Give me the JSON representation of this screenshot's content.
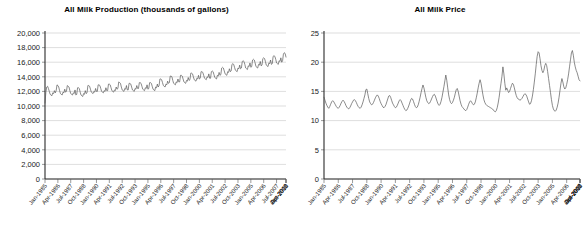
{
  "chart_data": [
    {
      "type": "line",
      "name": "all-milk-production",
      "title": "All Milk Production (thousands of gallons)",
      "xlabel": "",
      "ylabel": "",
      "ylim": [
        0,
        20000
      ],
      "ytick_labels": [
        "20,000",
        "18,000",
        "16,000",
        "14,000",
        "12,000",
        "10,000",
        "8,000",
        "6,000",
        "4,000",
        "2,000",
        "0"
      ],
      "ytick_values": [
        20000,
        18000,
        16000,
        14000,
        12000,
        10000,
        8000,
        6000,
        4000,
        2000,
        0
      ],
      "grid": true,
      "legend": "none",
      "xtick_labels": [
        "Jan-1985",
        "Apr-1986",
        "Jul-1987",
        "Oct-1988",
        "Jan-1990",
        "Apr-1991",
        "Jul-1992",
        "Oct-1993",
        "Jan-1995",
        "Apr-1996",
        "Jul-1997",
        "Oct-1998",
        "Jan-2000",
        "Apr-2001",
        "Jul-2002",
        "Oct-2003",
        "Jan-2005",
        "Apr-2006",
        "Jul-2007",
        "Oct-2008",
        "Jan-2010",
        "Apr-2011"
      ],
      "xtick_interval_months": 15,
      "x_start": "Jan-1985",
      "values": [
        10400,
        11900,
        12600,
        12700,
        12400,
        12000,
        11600,
        11500,
        11400,
        11800,
        11700,
        12100,
        11800,
        12100,
        12900,
        12800,
        12600,
        12100,
        11700,
        11600,
        11500,
        11900,
        11800,
        12300,
        11900,
        12000,
        12800,
        12700,
        12600,
        12100,
        11700,
        11600,
        11500,
        11800,
        11700,
        12200,
        11500,
        11600,
        12500,
        12500,
        12400,
        11900,
        11500,
        11400,
        11300,
        11700,
        11600,
        12100,
        11700,
        11800,
        12800,
        12800,
        12700,
        12300,
        11900,
        11800,
        11700,
        12000,
        11900,
        12400,
        12000,
        12000,
        12900,
        12900,
        12800,
        12400,
        12000,
        11900,
        11800,
        12100,
        12000,
        12500,
        12100,
        12100,
        13000,
        13000,
        12900,
        12500,
        12100,
        12000,
        11900,
        12200,
        12100,
        12600,
        12300,
        12400,
        13300,
        13200,
        13100,
        12600,
        12200,
        12100,
        12000,
        12400,
        12300,
        12800,
        12200,
        12200,
        13100,
        13100,
        13000,
        12600,
        12200,
        12100,
        12000,
        12400,
        12300,
        12800,
        12400,
        12400,
        13200,
        13200,
        13100,
        12700,
        12300,
        12200,
        12100,
        12500,
        12400,
        12900,
        12300,
        12400,
        13200,
        13200,
        13100,
        12700,
        12300,
        12200,
        12100,
        12600,
        12500,
        13000,
        12600,
        12800,
        13700,
        13700,
        13600,
        13200,
        12800,
        12700,
        12600,
        13000,
        12900,
        13400,
        13100,
        13200,
        14100,
        14100,
        14000,
        13500,
        13100,
        13000,
        12900,
        13300,
        13200,
        13700,
        13300,
        13300,
        14200,
        14200,
        14100,
        13700,
        13300,
        13200,
        13100,
        13500,
        13400,
        13900,
        13500,
        13600,
        14500,
        14500,
        14400,
        14000,
        13600,
        13500,
        13400,
        13800,
        13700,
        14200,
        13700,
        13800,
        14700,
        14700,
        14600,
        14200,
        13800,
        13700,
        13600,
        14000,
        13900,
        14400,
        13800,
        13800,
        14700,
        14800,
        14700,
        14300,
        13900,
        13800,
        13700,
        14200,
        14100,
        14600,
        14200,
        14300,
        15200,
        15300,
        15200,
        14800,
        14400,
        14300,
        14200,
        14700,
        14600,
        15100,
        14700,
        14800,
        15700,
        15800,
        15700,
        15300,
        14900,
        14800,
        14700,
        15200,
        15100,
        15600,
        15100,
        15200,
        16100,
        16200,
        16100,
        15700,
        15200,
        15100,
        15000,
        15500,
        15400,
        15900,
        15300,
        15400,
        16300,
        16400,
        16300,
        15900,
        15400,
        15300,
        15200,
        15700,
        15600,
        16100,
        15500,
        15600,
        16500,
        16600,
        16500,
        16100,
        15600,
        15500,
        15400,
        15900,
        15800,
        16300,
        15700,
        15800,
        16800,
        16900,
        16800,
        16400,
        15900,
        15800,
        15700,
        16200,
        16100,
        16600,
        16000,
        16200,
        17100,
        17300,
        17200,
        16700
      ]
    },
    {
      "type": "line",
      "name": "all-milk-price",
      "title": "All Milk Price",
      "xlabel": "",
      "ylabel": "",
      "ylim": [
        0,
        25
      ],
      "ytick_labels": [
        "25",
        "20",
        "15",
        "10",
        "5",
        "0"
      ],
      "ytick_values": [
        25,
        20,
        15,
        10,
        5,
        0
      ],
      "grid": true,
      "legend": "none",
      "xtick_labels": [
        "Jan-1985",
        "Apr-1986",
        "Jul-1987",
        "Oct-1988",
        "Jan-1990",
        "Apr-1991",
        "Jul-1992",
        "Oct-1993",
        "Jan-1995",
        "Apr-1996",
        "Jul-1997",
        "Oct-1998",
        "Jan-2000",
        "Apr-2001",
        "Jul-2002",
        "Oct-2003",
        "Jan-2005",
        "Apr-2006",
        "Jul-2007",
        "Oct-2008",
        "Jan-2010",
        "Apr-2011"
      ],
      "xtick_interval_months": 15,
      "x_start": "Jan-1985",
      "values": [
        14.0,
        13.5,
        13.0,
        12.6,
        12.3,
        12.1,
        12.4,
        12.8,
        13.2,
        13.4,
        13.3,
        13.0,
        12.7,
        12.4,
        12.2,
        12.1,
        12.3,
        12.6,
        13.0,
        13.3,
        13.5,
        13.3,
        13.0,
        12.6,
        12.3,
        12.1,
        12.0,
        12.2,
        12.5,
        12.9,
        13.2,
        13.5,
        13.6,
        13.4,
        13.1,
        12.7,
        12.4,
        12.2,
        12.1,
        12.3,
        12.7,
        13.2,
        13.8,
        14.4,
        15.3,
        15.4,
        14.6,
        13.8,
        13.2,
        12.9,
        12.7,
        12.8,
        13.1,
        13.5,
        13.9,
        14.2,
        14.4,
        14.2,
        13.8,
        13.3,
        12.9,
        12.6,
        12.3,
        12.2,
        12.4,
        12.7,
        13.2,
        13.7,
        14.2,
        14.3,
        14.0,
        13.5,
        13.0,
        12.7,
        12.4,
        12.2,
        12.3,
        12.6,
        13.0,
        13.4,
        13.6,
        13.4,
        13.0,
        12.6,
        12.2,
        11.9,
        11.7,
        11.8,
        12.1,
        12.5,
        13.0,
        13.5,
        13.8,
        13.7,
        13.3,
        12.8,
        12.4,
        12.2,
        12.3,
        12.7,
        13.3,
        14.0,
        14.8,
        15.5,
        16.1,
        15.6,
        14.8,
        14.0,
        13.4,
        13.1,
        12.9,
        13.0,
        13.3,
        13.7,
        14.1,
        14.4,
        14.5,
        14.2,
        13.7,
        13.2,
        12.8,
        12.6,
        12.8,
        13.3,
        14.0,
        14.9,
        15.8,
        16.8,
        17.8,
        16.9,
        15.6,
        14.4,
        13.6,
        13.1,
        12.9,
        13.1,
        13.5,
        14.0,
        14.7,
        15.3,
        15.5,
        15.0,
        14.2,
        13.4,
        12.8,
        12.4,
        12.2,
        12.0,
        11.8,
        11.7,
        11.9,
        12.3,
        12.8,
        13.2,
        13.4,
        13.2,
        12.9,
        12.7,
        12.8,
        13.2,
        13.9,
        14.7,
        15.6,
        16.4,
        17.0,
        16.4,
        15.4,
        14.4,
        13.6,
        13.1,
        12.8,
        12.6,
        12.5,
        12.4,
        12.3,
        12.2,
        12.1,
        12.0,
        11.8,
        11.6,
        11.5,
        11.7,
        12.2,
        13.0,
        14.0,
        15.2,
        16.4,
        17.6,
        19.2,
        18.0,
        16.4,
        15.2,
        15.6,
        15.2,
        14.8,
        15.0,
        15.5,
        16.0,
        16.4,
        16.2,
        15.6,
        14.9,
        14.3,
        13.9,
        13.7,
        13.6,
        13.5,
        13.6,
        13.8,
        14.1,
        14.4,
        14.6,
        14.5,
        14.2,
        13.7,
        13.2,
        12.8,
        12.9,
        13.4,
        14.2,
        15.3,
        16.6,
        18.0,
        19.6,
        21.0,
        21.8,
        21.6,
        20.6,
        19.4,
        18.6,
        18.2,
        18.6,
        19.4,
        19.8,
        19.4,
        18.4,
        17.2,
        16.0,
        14.8,
        13.6,
        12.6,
        12.0,
        11.7,
        11.6,
        11.8,
        12.3,
        13.0,
        14.0,
        15.2,
        16.4,
        17.2,
        16.6,
        15.8,
        15.4,
        15.6,
        16.2,
        17.0,
        18.0,
        19.2,
        20.4,
        21.6,
        22.0,
        21.2,
        20.0,
        19.2,
        18.6,
        18.2,
        17.6,
        17.0,
        16.8
      ]
    }
  ]
}
